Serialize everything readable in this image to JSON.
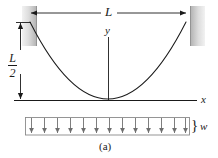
{
  "figure": {
    "caption": "(a)",
    "type": "engineering-diagram",
    "colors": {
      "line": "#1a1a1a",
      "wall_fill_light": "#e4e4e4",
      "wall_fill_dark": "#b9b9b9",
      "arrow": "#6f6f6f",
      "background": "#ffffff"
    }
  },
  "labels": {
    "span": "L",
    "sag_numerator": "L",
    "sag_denominator": "2",
    "axis_y": "y",
    "axis_x": "x",
    "load": "w",
    "brace": "}"
  },
  "geometry": {
    "span_px": 158,
    "left_wall_x": 22,
    "right_wall_x": 190,
    "axis_y_px": 100,
    "cable_left_anchor": [
      30,
      22
    ],
    "cable_vertex": [
      108,
      99
    ],
    "cable_right_anchor": [
      186,
      22
    ]
  },
  "load": {
    "arrow_count": 13,
    "box_left": 25,
    "box_right": 190,
    "box_top": 117,
    "box_bottom": 135
  },
  "icons": {
    "dimension_arrow": "double-headed-arrow",
    "load_arrow": "down-arrow",
    "wall": "fixed-support-hatched-wall"
  }
}
